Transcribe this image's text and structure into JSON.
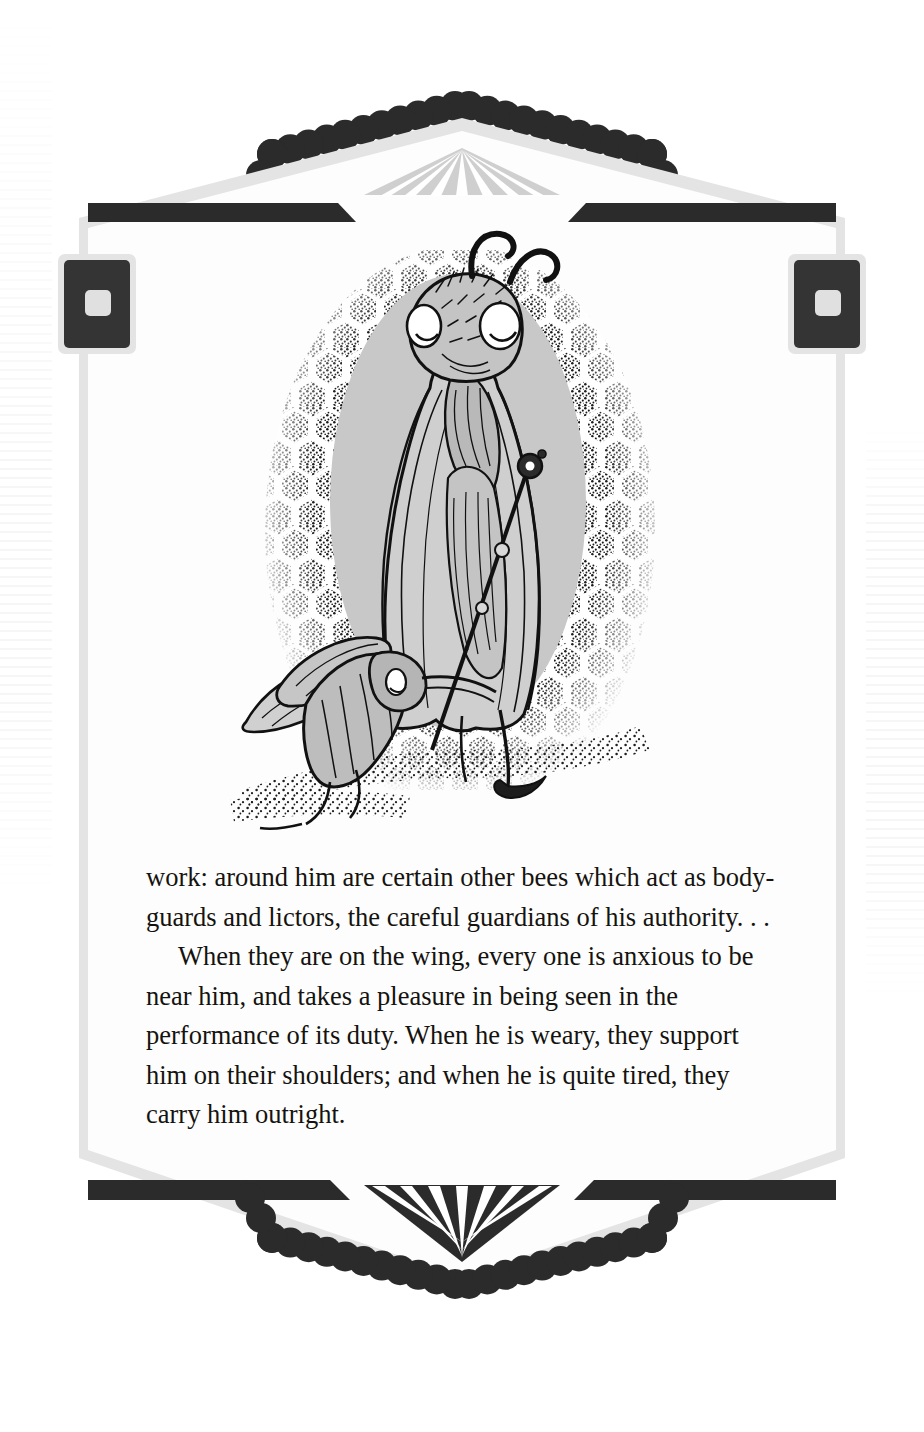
{
  "page": {
    "width": 924,
    "height": 1432,
    "background": "#ffffff",
    "kind": "illustrated-book-page"
  },
  "colors": {
    "ink": "#2b2b2b",
    "frame_edge": "#e2e2e2",
    "frame_fill": "#fdfdfd",
    "halo_gray": "#c8c8c8",
    "sunburst_gray": "#cfcfcf",
    "text": "#15130f",
    "page_background": "#ffffff"
  },
  "frame": {
    "name": "ornamental-border",
    "top_ornament": {
      "name": "top-peak-scallop",
      "scallops_per_slope": 10,
      "sunburst": {
        "rays": 7,
        "fill": "#cfcfcf",
        "ray_color": "#ffffff"
      }
    },
    "bottom_ornament": {
      "name": "bottom-vee-scallop",
      "scallops_per_slope": 10,
      "sunburst": {
        "rays": 9,
        "fill": "#2b2b2b",
        "ray_color": "#ffffff"
      }
    },
    "corner_blocks": [
      {
        "name": "corner-block-top-left",
        "inner_square": true
      },
      {
        "name": "corner-block-top-right",
        "inner_square": true
      }
    ],
    "rails": [
      {
        "name": "top-left-rail"
      },
      {
        "name": "top-right-rail"
      },
      {
        "name": "bottom-left-rail"
      },
      {
        "name": "bottom-right-rail"
      }
    ]
  },
  "illustration": {
    "name": "queen-bee-and-attendant",
    "caption": "",
    "description": "Pen-and-ink drawing of a regal queen bee in long robes holding a scepter, standing before a stippled honeycomb wall with a gray oval halo; a smaller worker bee bows low before her.",
    "elements": [
      {
        "name": "honeycomb-stipple-backdrop"
      },
      {
        "name": "gray-oval-halo"
      },
      {
        "name": "queen-bee-figure"
      },
      {
        "name": "queen-antennae"
      },
      {
        "name": "queen-scepter"
      },
      {
        "name": "queen-robe"
      },
      {
        "name": "bowing-worker-bee"
      },
      {
        "name": "ground-stipple"
      }
    ]
  },
  "body": {
    "paragraphs": [
      {
        "indent": false,
        "text": "work: around him are certain other bees which act as body-guards and lictors, the careful guardians of his authority. . ."
      },
      {
        "indent": true,
        "text": "When they are on the wing, every one is anxious to be near him, and takes a pleasure in being seen in the performance of its duty. When he is weary, they support him on their shoulders; and when he is quite tired, they carry him outright."
      }
    ]
  }
}
